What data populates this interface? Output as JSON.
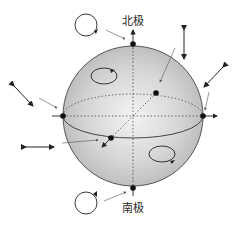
{
  "diagram": {
    "labels": {
      "north_pole": "北极",
      "south_pole": "南极"
    },
    "colors": {
      "sphere_fill_center": "#f4f4f4",
      "sphere_fill_edge": "#bdbdbd",
      "stroke": "#222222",
      "pointer": "#555555"
    }
  }
}
